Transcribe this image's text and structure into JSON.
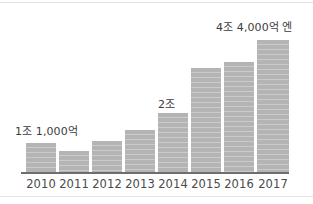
{
  "chart_data": {
    "type": "bar",
    "title": "",
    "subtitle": "",
    "xlabel": "",
    "ylabel": "",
    "categories": [
      "2010",
      "2011",
      "2012",
      "2013",
      "2014",
      "2015",
      "2016",
      "2017"
    ],
    "values": [
      1.1,
      0.95,
      1.2,
      1.45,
      2.0,
      3.55,
      3.75,
      4.4
    ],
    "value_unit": "조 엔",
    "ylim": [
      0,
      4.9
    ],
    "grid": false,
    "legend": null,
    "series": [
      {
        "name": "",
        "values": [
          1.1,
          0.95,
          1.2,
          1.45,
          2.0,
          3.55,
          3.75,
          4.4
        ]
      }
    ],
    "bar_pixels": [
      {
        "category": "2010",
        "left": 26,
        "width": 30,
        "top": 143,
        "bottom": 172
      },
      {
        "category": "2011",
        "left": 59,
        "width": 30,
        "top": 151,
        "bottom": 172
      },
      {
        "category": "2012",
        "left": 92,
        "width": 30,
        "top": 141,
        "bottom": 172
      },
      {
        "category": "2013",
        "left": 125,
        "width": 30,
        "top": 130,
        "bottom": 172
      },
      {
        "category": "2014",
        "left": 158,
        "width": 30,
        "top": 113,
        "bottom": 172
      },
      {
        "category": "2015",
        "left": 191,
        "width": 30,
        "top": 68,
        "bottom": 172
      },
      {
        "category": "2016",
        "left": 224,
        "width": 30,
        "top": 62,
        "bottom": 172
      },
      {
        "category": "2017",
        "left": 257,
        "width": 32,
        "top": 40,
        "bottom": 172
      }
    ],
    "annotations": [
      {
        "text": "1조 1,000억",
        "category": "2010"
      },
      {
        "text": "2조",
        "category": "2014"
      },
      {
        "text": "4조 4,000억 엔",
        "category": "2017"
      }
    ],
    "colors": {
      "bar": "#b4b4b4",
      "axis": "#6e6e6e",
      "tick_label": "#4a4a4a",
      "annotation": "#3c3c3c",
      "background": "#ffffff",
      "edge_rule": "#e3e3e3"
    }
  }
}
